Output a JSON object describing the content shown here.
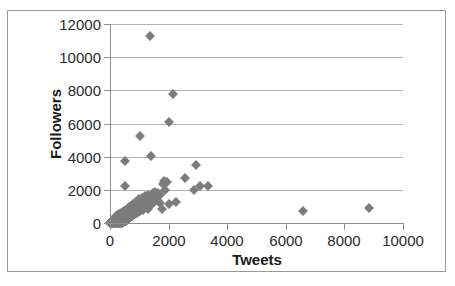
{
  "chart_data": {
    "type": "scatter",
    "title": "",
    "xlabel": "Tweets",
    "ylabel": "Followers",
    "xlim": [
      0,
      10000
    ],
    "ylim": [
      0,
      12000
    ],
    "xticks": [
      0,
      2000,
      4000,
      6000,
      8000,
      10000
    ],
    "yticks": [
      0,
      2000,
      4000,
      6000,
      8000,
      10000,
      12000
    ],
    "xtick_labels": [
      "0",
      "2000",
      "4000",
      "6000",
      "8000",
      "10000"
    ],
    "ytick_labels": [
      "0",
      "2000",
      "4000",
      "6000",
      "8000",
      "10000",
      "12000"
    ],
    "grid": "horizontal",
    "legend": "none",
    "marker": "diamond",
    "marker_color": "#7c7c7c",
    "series": [
      {
        "name": "Accounts",
        "points": [
          [
            1350,
            11300
          ],
          [
            2150,
            7800
          ],
          [
            2010,
            6110
          ],
          [
            1030,
            5250
          ],
          [
            1390,
            4070
          ],
          [
            520,
            3720
          ],
          [
            2950,
            3530
          ],
          [
            2560,
            2700
          ],
          [
            1840,
            2520
          ],
          [
            1940,
            2500
          ],
          [
            3350,
            2230
          ],
          [
            3060,
            2220
          ],
          [
            510,
            2250
          ],
          [
            1800,
            2380
          ],
          [
            2880,
            2010
          ],
          [
            1880,
            1990
          ],
          [
            1550,
            1900
          ],
          [
            1450,
            1830
          ],
          [
            1640,
            1790
          ],
          [
            1700,
            1720
          ],
          [
            1290,
            1700
          ],
          [
            1200,
            1640
          ],
          [
            1380,
            1600
          ],
          [
            1100,
            1540
          ],
          [
            1520,
            1500
          ],
          [
            1250,
            1450
          ],
          [
            980,
            1430
          ],
          [
            1600,
            1400
          ],
          [
            2250,
            1270
          ],
          [
            1150,
            1330
          ],
          [
            1050,
            1300
          ],
          [
            900,
            1250
          ],
          [
            1340,
            1240
          ],
          [
            1480,
            1200
          ],
          [
            1720,
            1180
          ],
          [
            2000,
            1150
          ],
          [
            1780,
            870
          ],
          [
            860,
            1180
          ],
          [
            790,
            1140
          ],
          [
            1180,
            1100
          ],
          [
            1400,
            1080
          ],
          [
            960,
            1050
          ],
          [
            1090,
            1020
          ],
          [
            730,
            1000
          ],
          [
            1260,
            980
          ],
          [
            8850,
            900
          ],
          [
            6600,
            700
          ],
          [
            650,
            950
          ],
          [
            880,
            930
          ],
          [
            1020,
            910
          ],
          [
            1160,
            890
          ],
          [
            600,
            870
          ],
          [
            770,
            860
          ],
          [
            930,
            840
          ],
          [
            1300,
            830
          ],
          [
            560,
            810
          ],
          [
            700,
            800
          ],
          [
            840,
            790
          ],
          [
            1000,
            780
          ],
          [
            1120,
            760
          ],
          [
            520,
            750
          ],
          [
            640,
            740
          ],
          [
            760,
            730
          ],
          [
            890,
            720
          ],
          [
            1010,
            710
          ],
          [
            470,
            700
          ],
          [
            590,
            690
          ],
          [
            710,
            680
          ],
          [
            830,
            670
          ],
          [
            950,
            660
          ],
          [
            430,
            650
          ],
          [
            550,
            640
          ],
          [
            670,
            630
          ],
          [
            790,
            625
          ],
          [
            910,
            615
          ],
          [
            390,
            610
          ],
          [
            500,
            600
          ],
          [
            620,
            595
          ],
          [
            740,
            585
          ],
          [
            860,
            575
          ],
          [
            350,
            570
          ],
          [
            460,
            560
          ],
          [
            580,
            550
          ],
          [
            700,
            545
          ],
          [
            820,
            535
          ],
          [
            310,
            530
          ],
          [
            420,
            520
          ],
          [
            540,
            515
          ],
          [
            660,
            505
          ],
          [
            780,
            495
          ],
          [
            280,
            490
          ],
          [
            390,
            480
          ],
          [
            510,
            475
          ],
          [
            630,
            465
          ],
          [
            750,
            455
          ],
          [
            250,
            450
          ],
          [
            360,
            440
          ],
          [
            480,
            435
          ],
          [
            600,
            425
          ],
          [
            720,
            415
          ],
          [
            220,
            410
          ],
          [
            330,
            400
          ],
          [
            450,
            395
          ],
          [
            570,
            385
          ],
          [
            690,
            375
          ],
          [
            200,
            370
          ],
          [
            300,
            360
          ],
          [
            420,
            355
          ],
          [
            540,
            345
          ],
          [
            660,
            340
          ],
          [
            180,
            330
          ],
          [
            280,
            325
          ],
          [
            400,
            315
          ],
          [
            520,
            310
          ],
          [
            640,
            300
          ],
          [
            160,
            295
          ],
          [
            260,
            290
          ],
          [
            380,
            280
          ],
          [
            500,
            275
          ],
          [
            620,
            265
          ],
          [
            140,
            260
          ],
          [
            240,
            255
          ],
          [
            360,
            245
          ],
          [
            480,
            240
          ],
          [
            600,
            230
          ],
          [
            120,
            225
          ],
          [
            220,
            220
          ],
          [
            340,
            215
          ],
          [
            460,
            205
          ],
          [
            580,
            200
          ],
          [
            100,
            195
          ],
          [
            200,
            190
          ],
          [
            320,
            180
          ],
          [
            440,
            175
          ],
          [
            560,
            170
          ],
          [
            90,
            165
          ],
          [
            185,
            160
          ],
          [
            300,
            155
          ],
          [
            420,
            150
          ],
          [
            540,
            145
          ],
          [
            80,
            140
          ],
          [
            170,
            135
          ],
          [
            285,
            130
          ],
          [
            400,
            125
          ],
          [
            515,
            120
          ],
          [
            70,
            115
          ],
          [
            155,
            110
          ],
          [
            265,
            105
          ],
          [
            380,
            100
          ],
          [
            495,
            95
          ],
          [
            60,
            90
          ],
          [
            140,
            88
          ],
          [
            250,
            84
          ],
          [
            360,
            80
          ],
          [
            470,
            76
          ],
          [
            52,
            72
          ],
          [
            125,
            68
          ],
          [
            235,
            64
          ],
          [
            345,
            60
          ],
          [
            455,
            58
          ],
          [
            45,
            54
          ],
          [
            110,
            50
          ],
          [
            215,
            48
          ],
          [
            325,
            45
          ],
          [
            435,
            42
          ],
          [
            38,
            40
          ],
          [
            95,
            36
          ],
          [
            200,
            34
          ],
          [
            305,
            32
          ],
          [
            410,
            30
          ],
          [
            30,
            28
          ],
          [
            85,
            26
          ],
          [
            185,
            24
          ],
          [
            290,
            22
          ],
          [
            395,
            20
          ],
          [
            25,
            18
          ],
          [
            70,
            16
          ],
          [
            170,
            15
          ],
          [
            270,
            14
          ],
          [
            375,
            12
          ],
          [
            20,
            10
          ],
          [
            60,
            9
          ],
          [
            155,
            8
          ],
          [
            255,
            7
          ],
          [
            355,
            6
          ],
          [
            15,
            5
          ],
          [
            50,
            5
          ],
          [
            140,
            4
          ],
          [
            240,
            4
          ],
          [
            340,
            3
          ],
          [
            10,
            3
          ],
          [
            40,
            2
          ],
          [
            125,
            2
          ],
          [
            225,
            2
          ],
          [
            320,
            2
          ]
        ]
      }
    ]
  },
  "caption": {
    "artifact_text": ""
  }
}
